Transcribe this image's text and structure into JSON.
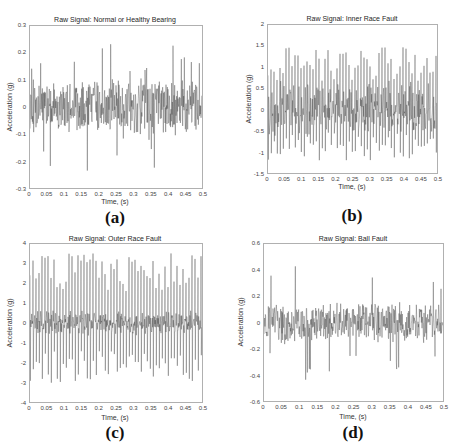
{
  "chart_data": [
    {
      "type": "line",
      "panel": "a",
      "caption": "(a)",
      "title": "Raw Signal: Normal or Healthy Bearing",
      "xlabel": "Time, (s)",
      "ylabel": "Acceleration (g)",
      "xlim": [
        0,
        0.5
      ],
      "ylim": [
        -0.3,
        0.3
      ],
      "xticks": [
        "0",
        "0.05",
        "0.1",
        "0.15",
        "0.2",
        "0.25",
        "0.3",
        "0.35",
        "0.4",
        "0.45",
        "0.5"
      ],
      "yticks": [
        "0.3",
        "0.2",
        "0.1",
        "0",
        "-0.1",
        "-0.2",
        "-0.3"
      ],
      "signal": {
        "baseline_amp": 0.09,
        "peak_max": 0.22,
        "peak_min": -0.27,
        "impulses": 0
      },
      "grid": false
    },
    {
      "type": "line",
      "panel": "b",
      "caption": "(b)",
      "title": "Raw Signal: Inner Race Fault",
      "xlabel": "Time, (s)",
      "ylabel": "Acceleration (g)",
      "xlim": [
        0,
        0.5
      ],
      "ylim": [
        -1.5,
        2
      ],
      "xticks": [
        "0",
        "0.05",
        "0.1",
        "0.15",
        "0.2",
        "0.25",
        "0.3",
        "0.35",
        "0.4",
        "0.45",
        "0.5"
      ],
      "yticks": [
        "2",
        "1.5",
        "1",
        "0.5",
        "0",
        "-0.5",
        "-1",
        "-1.5"
      ],
      "signal": {
        "baseline_amp": 0.25,
        "peak_max": 1.48,
        "peak_min": -1.2,
        "impulses": 54
      },
      "grid": false
    },
    {
      "type": "line",
      "panel": "c",
      "caption": "(c)",
      "title": "Raw Signal: Outer Race Fault",
      "xlabel": "Time, (s)",
      "ylabel": "Acceleration (g)",
      "xlim": [
        0,
        0.5
      ],
      "ylim": [
        -4,
        4
      ],
      "xticks": [
        "0",
        "0.05",
        "0.1",
        "0.15",
        "0.2",
        "0.25",
        "0.3",
        "0.35",
        "0.4",
        "0.45",
        "0.5"
      ],
      "yticks": [
        "4",
        "3",
        "2",
        "1",
        "0",
        "-1",
        "-2",
        "-3",
        "-4"
      ],
      "signal": {
        "baseline_amp": 0.25,
        "peak_max": 3.6,
        "peak_min": -3.1,
        "impulses": 54
      },
      "grid": false
    },
    {
      "type": "line",
      "panel": "d",
      "caption": "(d)",
      "title": "Raw Signal: Ball Fault",
      "xlabel": "Time, (s)",
      "ylabel": "Acceleration (g)",
      "xlim": [
        0,
        0.5
      ],
      "ylim": [
        -0.6,
        0.6
      ],
      "xticks": [
        "0",
        "0.05",
        "0.1",
        "0.15",
        "0.2",
        "0.25",
        "0.3",
        "0.35",
        "0.4",
        "0.45",
        "0.5"
      ],
      "yticks": [
        "0.6",
        "0.4",
        "0.2",
        "0",
        "-0.2",
        "-0.4",
        "-0.6"
      ],
      "signal": {
        "baseline_amp": 0.14,
        "peak_max": 0.5,
        "peak_min": -0.49,
        "impulses": 0
      },
      "grid": false
    }
  ],
  "colors": {
    "signal": "#3a3a3a",
    "axes": "#b0b0b0",
    "text": "#333333"
  }
}
